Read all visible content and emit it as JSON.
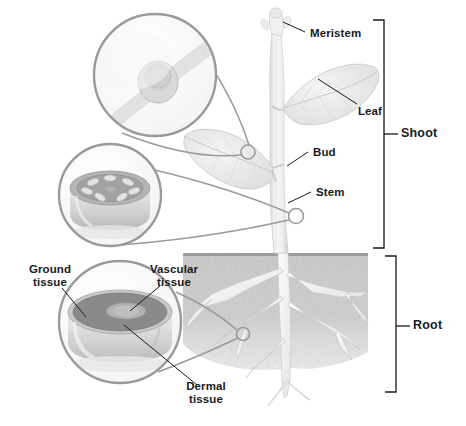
{
  "figure": {
    "background_color": "#ffffff",
    "ink_color": "#1a1a1a",
    "circle_stroke_color": "#9a9a9a",
    "soil_color": "#b4b4b4"
  },
  "labels": {
    "meristem": "Meristem",
    "leaf": "Leaf",
    "bud": "Bud",
    "stem": "Stem",
    "shoot": "Shoot",
    "root": "Root",
    "ground_tissue_line1": "Ground",
    "ground_tissue_line2": "tissue",
    "vascular_tissue_line1": "Vascular",
    "vascular_tissue_line2": "tissue",
    "dermal_tissue_line1": "Dermal",
    "dermal_tissue_line2": "tissue"
  },
  "brackets": [
    {
      "name": "shoot",
      "label": "Shoot",
      "top": 20,
      "bottom": 248,
      "x": 384,
      "label_y": 134
    },
    {
      "name": "root",
      "label": "Root",
      "top": 256,
      "bottom": 392,
      "x": 396,
      "label_y": 326
    }
  ],
  "magnifiers": [
    {
      "name": "meristem-inset",
      "caption": "",
      "cx": 155,
      "cy": 75,
      "r": 62,
      "target_cx": 248,
      "target_cy": 152,
      "target_r": 7,
      "content": "apical meristem longitudinal section"
    },
    {
      "name": "stem-cross-section-inset",
      "caption": "",
      "cx": 110,
      "cy": 195,
      "r": 52,
      "target_cx": 296,
      "target_cy": 216,
      "target_r": 7,
      "content": "stem cross section with vascular bundles"
    },
    {
      "name": "root-cross-section-inset",
      "caption": "",
      "cx": 120,
      "cy": 322,
      "r": 62,
      "target_cx": 243,
      "target_cy": 334,
      "target_r": 7,
      "content": "root cross section showing dermal, ground and vascular tissue"
    }
  ],
  "tissue_callouts": [
    {
      "name": "ground-tissue",
      "line1": "Ground",
      "line2": "tissue",
      "x": 48,
      "y": 264
    },
    {
      "name": "vascular-tissue",
      "line1": "Vascular",
      "line2": "tissue",
      "x": 173,
      "y": 264
    },
    {
      "name": "dermal-tissue",
      "line1": "Dermal",
      "line2": "tissue",
      "x": 206,
      "y": 381
    }
  ],
  "part_callouts": [
    {
      "name": "meristem",
      "label": "Meristem",
      "x": 310,
      "y": 27
    },
    {
      "name": "leaf",
      "label": "Leaf",
      "x": 358,
      "y": 105
    },
    {
      "name": "bud",
      "label": "Bud",
      "x": 313,
      "y": 146
    },
    {
      "name": "stem",
      "label": "Stem",
      "x": 316,
      "y": 186
    }
  ],
  "soil": {
    "name": "soil",
    "top_y": 253,
    "left_x": 183,
    "right_x": 368
  }
}
